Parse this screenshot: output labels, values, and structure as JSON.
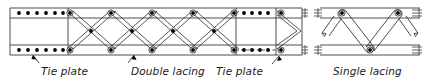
{
  "figure": {
    "background_color": "#ffffff",
    "line_color": "#3a3a3a",
    "rivet_color": "#000000",
    "text_color": "#1a1a1a",
    "width": 427,
    "height": 83
  },
  "labels": {
    "tie_plate_left": "Tie plate",
    "double_lacing": "Double lacing",
    "tie_plate_right": "Tie plate",
    "single_lacing": "Single lacing"
  },
  "panels": {
    "left": {
      "name": "double-lacing-member",
      "x": 10,
      "y": 8,
      "width": 292,
      "height": 47,
      "flange_thickness": 10,
      "segments": [
        {
          "type": "tie-plate",
          "x": 10,
          "width": 58,
          "rivets_top": 6,
          "rivets_bottom": 6
        },
        {
          "type": "double-lacing",
          "x": 68,
          "width": 166,
          "bays": 4
        },
        {
          "type": "tie-plate",
          "x": 234,
          "width": 68,
          "rivets_top": 4,
          "rivets_bottom": 4,
          "bottom_edge": "dashed"
        }
      ]
    },
    "right": {
      "name": "single-lacing-member",
      "x": 320,
      "y": 8,
      "width": 100,
      "height": 47,
      "flange_thickness": 10,
      "bars": 3,
      "nodes": 3
    }
  },
  "annotations": {
    "leaders": [
      {
        "name": "tie-plate-left-leader",
        "from": [
          39,
          62
        ],
        "to": [
          34,
          55
        ]
      },
      {
        "name": "double-lacing-leader",
        "from": [
          128,
          62
        ],
        "to": [
          134,
          55
        ]
      },
      {
        "name": "tie-plate-right-leader",
        "from": [
          268,
          63
        ],
        "to": [
          276,
          55
        ]
      },
      {
        "name": "single-lacing-leader",
        "from": [
          0,
          0
        ],
        "to": [
          0,
          0
        ]
      }
    ]
  }
}
